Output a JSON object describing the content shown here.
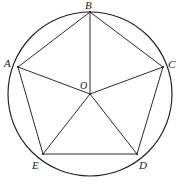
{
  "figure": {
    "kind": "geometry-diagram",
    "width": 180,
    "height": 186,
    "background_color": "#ffffff",
    "line_color": "#2b2b2b",
    "circle_color": "#1f1f1f",
    "label_color": "#1b1b1b"
  },
  "circle": {
    "name": "circumcircle",
    "center_label": "O",
    "cx": 90,
    "cy": 94,
    "r": 82
  },
  "points": [
    {
      "id": "A",
      "label": "A",
      "x": 18,
      "y": 67,
      "label_x": 4,
      "label_y": 58
    },
    {
      "id": "B",
      "label": "B",
      "x": 90,
      "y": 12,
      "label_x": 85,
      "label_y": 0
    },
    {
      "id": "C",
      "label": "C",
      "x": 163,
      "y": 67,
      "label_x": 168,
      "label_y": 59
    },
    {
      "id": "D",
      "label": "D",
      "x": 137,
      "y": 154,
      "label_x": 139,
      "label_y": 160
    },
    {
      "id": "E",
      "label": "E",
      "x": 43,
      "y": 154,
      "label_x": 32,
      "label_y": 160
    },
    {
      "id": "O",
      "label": "O",
      "x": 90,
      "y": 94,
      "label_x": 80,
      "label_y": 80
    }
  ],
  "pentagon_sides": [
    {
      "name": "side-AB",
      "from": "A",
      "to": "B"
    },
    {
      "name": "side-BC",
      "from": "B",
      "to": "C"
    },
    {
      "name": "side-CD",
      "from": "C",
      "to": "D"
    },
    {
      "name": "side-DE",
      "from": "D",
      "to": "E"
    },
    {
      "name": "side-EA",
      "from": "E",
      "to": "A"
    }
  ],
  "radii": [
    {
      "name": "radius-OA",
      "from": "O",
      "to": "A"
    },
    {
      "name": "radius-OB",
      "from": "O",
      "to": "B"
    },
    {
      "name": "radius-OC",
      "from": "O",
      "to": "C"
    },
    {
      "name": "radius-OD",
      "from": "O",
      "to": "D"
    },
    {
      "name": "radius-OE",
      "from": "O",
      "to": "E"
    }
  ]
}
